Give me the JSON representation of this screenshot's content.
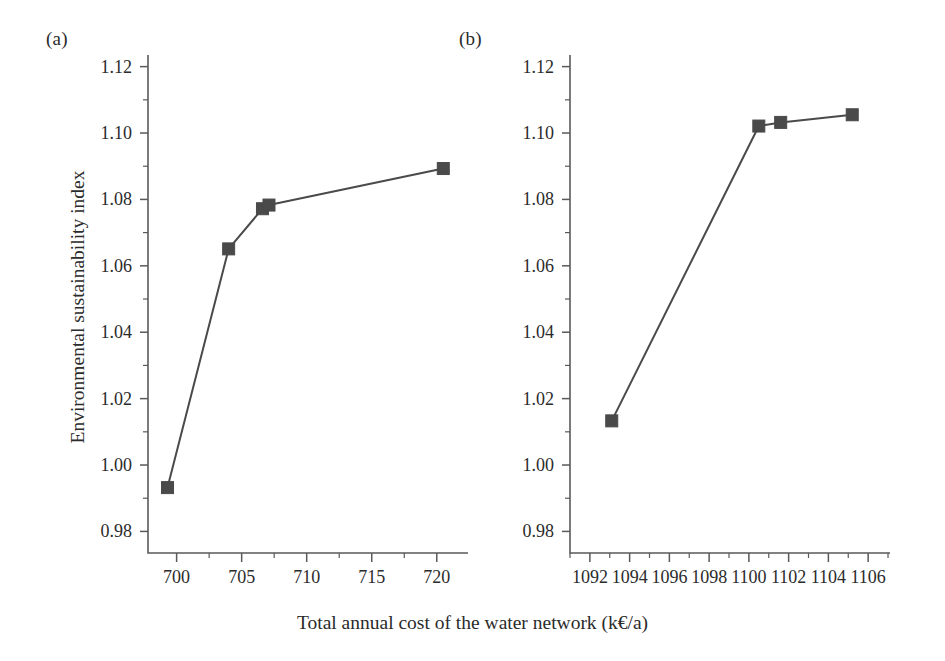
{
  "figure": {
    "xlabel": "Total annual cost of the water network (k€/a)",
    "ylabel": "Environmental sustainability index",
    "panel_a_label": "(a)",
    "panel_b_label": "(b)",
    "line_color": "#4a4a4a",
    "marker_color": "#4a4a4a",
    "axis_color": "#5a5a5a",
    "background": "#ffffff"
  },
  "chart_data": [
    {
      "type": "line",
      "panel": "(a)",
      "title": "",
      "xlabel": "Total annual cost of the water network (k€/a)",
      "ylabel": "Environmental sustainability index",
      "xlim": [
        697.8,
        722.4
      ],
      "ylim": [
        0.9735,
        1.1235
      ],
      "xticks": [
        700,
        705,
        710,
        715,
        720
      ],
      "xticklabels": [
        "700",
        "705",
        "710",
        "715",
        "720"
      ],
      "xminor_step": 2.5,
      "yticks": [
        0.98,
        1.0,
        1.02,
        1.04,
        1.06,
        1.08,
        1.1,
        1.12
      ],
      "yticklabels": [
        "0.98",
        "1.00",
        "1.02",
        "1.04",
        "1.06",
        "1.08",
        "1.10",
        "1.12"
      ],
      "yminor_step": 0.01,
      "grid": false,
      "legend": "none",
      "marker": "square",
      "x": [
        699.3,
        704.0,
        706.6,
        707.1,
        720.5
      ],
      "y": [
        0.9932,
        1.0651,
        1.0772,
        1.0783,
        1.0893
      ]
    },
    {
      "type": "line",
      "panel": "(b)",
      "title": "",
      "xlabel": "Total annual cost of the water network (k€/a)",
      "ylabel": "Environmental sustainability index",
      "xlim": [
        1091.0,
        1107.1
      ],
      "ylim": [
        0.9735,
        1.1235
      ],
      "xticks": [
        1092,
        1094,
        1096,
        1098,
        1100,
        1102,
        1104,
        1106
      ],
      "xticklabels": [
        "1092",
        "1094",
        "1096",
        "1098",
        "1100",
        "1102",
        "1104",
        "1106"
      ],
      "xminor_step": 1,
      "yticks": [
        0.98,
        1.0,
        1.02,
        1.04,
        1.06,
        1.08,
        1.1,
        1.12
      ],
      "yticklabels": [
        "0.98",
        "1.00",
        "1.02",
        "1.04",
        "1.06",
        "1.08",
        "1.10",
        "1.12"
      ],
      "yminor_step": 0.01,
      "grid": false,
      "legend": "none",
      "marker": "square",
      "x": [
        1093.1,
        1100.5,
        1101.6,
        1105.2
      ],
      "y": [
        1.0133,
        1.1021,
        1.1032,
        1.1055
      ]
    }
  ]
}
